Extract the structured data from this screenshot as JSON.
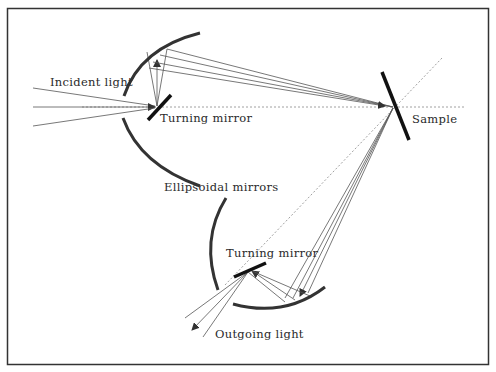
{
  "diagram": {
    "labels": {
      "incident_light": "Incident light",
      "turning_mirror_top": "Turning mirror",
      "sample": "Sample",
      "ellipsoidal_mirrors": "Ellipsoidal mirrors",
      "turning_mirror_bottom": "Turning mirror",
      "outgoing_light": "Outgoing light"
    },
    "colors": {
      "frame": "#333333",
      "mirror": "#333333",
      "ray": "#555555",
      "axis": "#888888"
    }
  }
}
